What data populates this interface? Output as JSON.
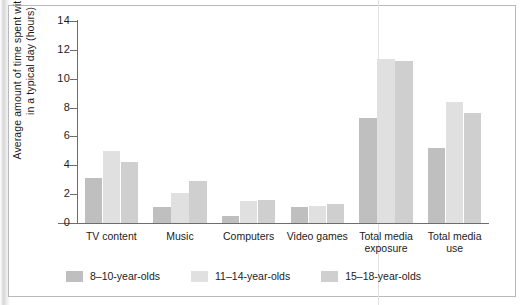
{
  "chart_data": {
    "type": "bar",
    "title": "",
    "xlabel": "",
    "ylabel": "Average amount of time spent with media in a typical day (hours)",
    "ylim": [
      0,
      14
    ],
    "yticks": [
      0,
      2,
      4,
      6,
      8,
      10,
      12,
      14
    ],
    "ytick_labels": [
      "0",
      "2",
      "4",
      "6",
      "8",
      "10",
      "12",
      "14"
    ],
    "grid": false,
    "legend_position": "bottom",
    "categories": [
      "TV content",
      "Music",
      "Computers",
      "Video games",
      "Total media exposure",
      "Total media use"
    ],
    "series": [
      {
        "name": "8–10-year-olds",
        "color": "#bfbfbf",
        "values": [
          3.1,
          1.1,
          0.5,
          1.1,
          7.3,
          5.2
        ]
      },
      {
        "name": "11–14-year-olds",
        "color": "#e0e0e0",
        "values": [
          5.0,
          2.1,
          1.5,
          1.2,
          11.4,
          8.4
        ]
      },
      {
        "name": "15–18-year-olds",
        "color": "#cfcfcf",
        "values": [
          4.2,
          2.9,
          1.6,
          1.3,
          11.2,
          7.6
        ]
      }
    ]
  },
  "colors": {
    "axis": "#6d6d6d",
    "frame": "#b9b9b9",
    "text": "#1c1c1c",
    "background": "#ffffff"
  }
}
